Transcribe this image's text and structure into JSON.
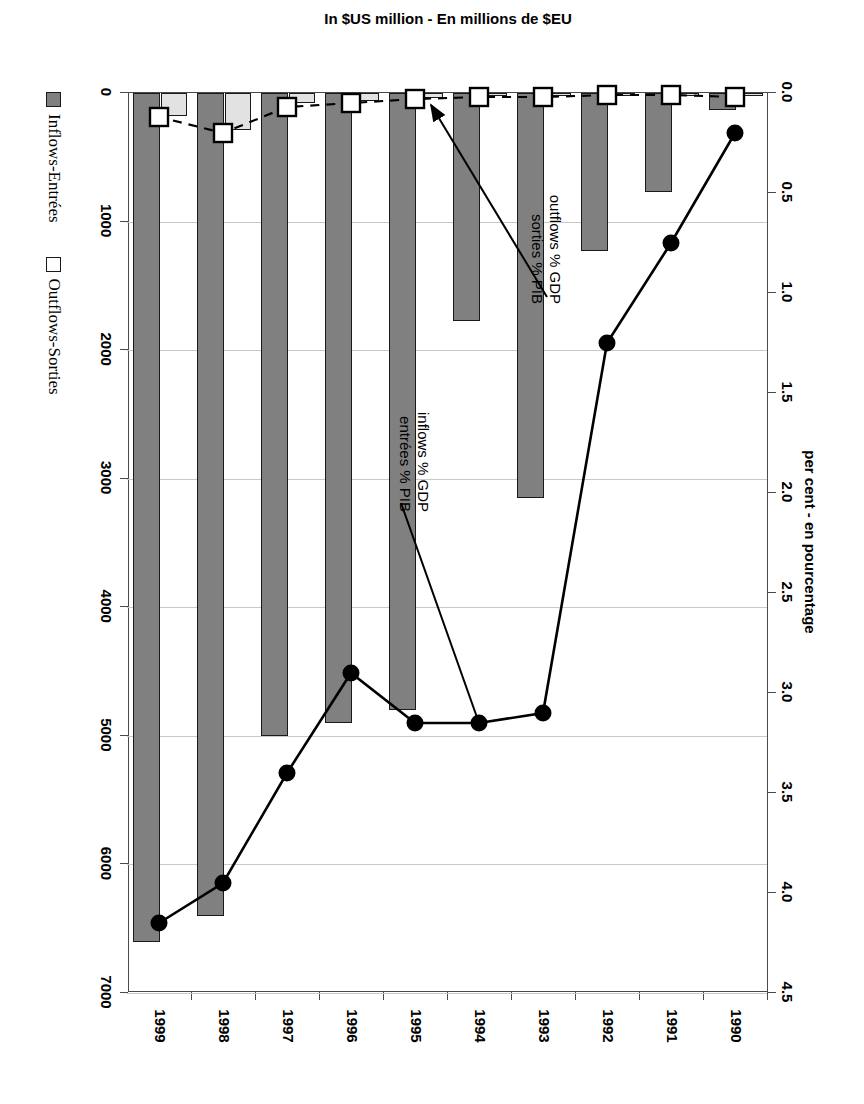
{
  "chart_data": {
    "type": "bar",
    "title": "",
    "subtitle": "",
    "orientation": "rotated-90-clockwise",
    "categories": [
      "1990",
      "1991",
      "1992",
      "1993",
      "1994",
      "1995",
      "1996",
      "1997",
      "1998",
      "1999"
    ],
    "xlabel": "",
    "ylabel": "In $US million - En millions de $EU",
    "y2label": "per cent - en pourcentage",
    "ylim": [
      0,
      7000
    ],
    "yticks": [
      "0",
      "1000",
      "2000",
      "3000",
      "4000",
      "5000",
      "6000",
      "7000"
    ],
    "y2lim": [
      0,
      4.5
    ],
    "y2ticks": [
      "0.0",
      "0.5",
      "1.0",
      "1.5",
      "2.0",
      "2.5",
      "3.0",
      "3.5",
      "4.0",
      "4.5"
    ],
    "grid": true,
    "legend_position": "bottom-left",
    "series": [
      {
        "name": "Inflows-Entrées",
        "kind": "bar",
        "axis": "left",
        "color": "#808080",
        "values": [
          130,
          770,
          1230,
          3150,
          1770,
          4800,
          4900,
          5000,
          6400,
          6600
        ]
      },
      {
        "name": "Outflows-Sorties",
        "kind": "bar",
        "axis": "left",
        "color": "#e2e2e2",
        "values": [
          15,
          10,
          12,
          20,
          20,
          35,
          60,
          80,
          290,
          180
        ]
      },
      {
        "name": "inflows % GDP / entrées % PIB",
        "kind": "line-solid",
        "axis": "right",
        "color": "#000000",
        "values": [
          0.2,
          0.75,
          1.25,
          3.1,
          3.15,
          3.15,
          2.9,
          3.4,
          3.95,
          4.15
        ]
      },
      {
        "name": "outflows % GDP / sorties % PIB",
        "kind": "line-dashed",
        "axis": "right",
        "color": "#000000",
        "values": [
          0.02,
          0.01,
          0.01,
          0.02,
          0.02,
          0.03,
          0.05,
          0.07,
          0.2,
          0.12
        ]
      }
    ],
    "annotations": [
      {
        "id": "inflows-annotation",
        "line1": "inflows % GDP",
        "line2": "entrées % PIB",
        "points_to_category": "1994"
      },
      {
        "id": "outflows-annotation",
        "line1": "outflows % GDP",
        "line2": "sorties % PIB",
        "points_to_category": "1995"
      }
    ]
  },
  "axes": {
    "left_title": "In $US million - En millions de $EU",
    "top_title": "per cent - en pourcentage",
    "left_ticks": [
      "7000",
      "6000",
      "5000",
      "4000",
      "3000",
      "2000",
      "1000",
      "0"
    ],
    "top_ticks": [
      "4.5",
      "4.0",
      "3.5",
      "3.0",
      "2.5",
      "2.0",
      "1.5",
      "1.0",
      "0.5",
      "0.0"
    ],
    "categories": [
      "1990",
      "1991",
      "1992",
      "1993",
      "1994",
      "1995",
      "1996",
      "1997",
      "1998",
      "1999"
    ]
  },
  "legend": {
    "items": [
      {
        "label": "Inflows-Entrées",
        "color": "#808080",
        "swatch": "filled-square"
      },
      {
        "label": "Outflows-Sorties",
        "color": "#ffffff",
        "swatch": "open-square"
      }
    ]
  },
  "annotations": {
    "inflows": {
      "line1": "inflows % GDP",
      "line2": "entrées % PIB"
    },
    "outflows": {
      "line1": "outflows % GDP",
      "line2": "sorties % PIB"
    }
  },
  "colors": {
    "inflow_bar": "#808080",
    "outflow_bar": "#e2e2e2",
    "line": "#000000",
    "frame": "#4a4a4a",
    "grid": "#c9c9c9"
  }
}
